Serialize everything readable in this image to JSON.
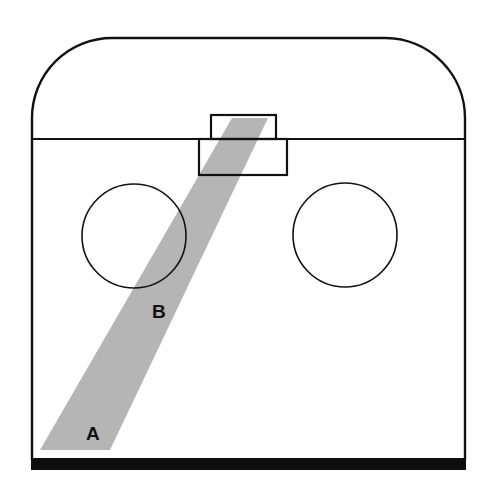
{
  "diagram": {
    "labels": {
      "a": "A",
      "b": "B"
    },
    "colors": {
      "stroke": "#111111",
      "beam": "#b4b4b4",
      "background": "#ffffff",
      "floor": "#0d0d0d"
    },
    "elements": [
      "arched-top-enclosure",
      "divider-line",
      "top-slit-box",
      "lower-slit-box",
      "left-circle",
      "right-circle",
      "diagonal-light-beam",
      "floor-bar"
    ]
  }
}
